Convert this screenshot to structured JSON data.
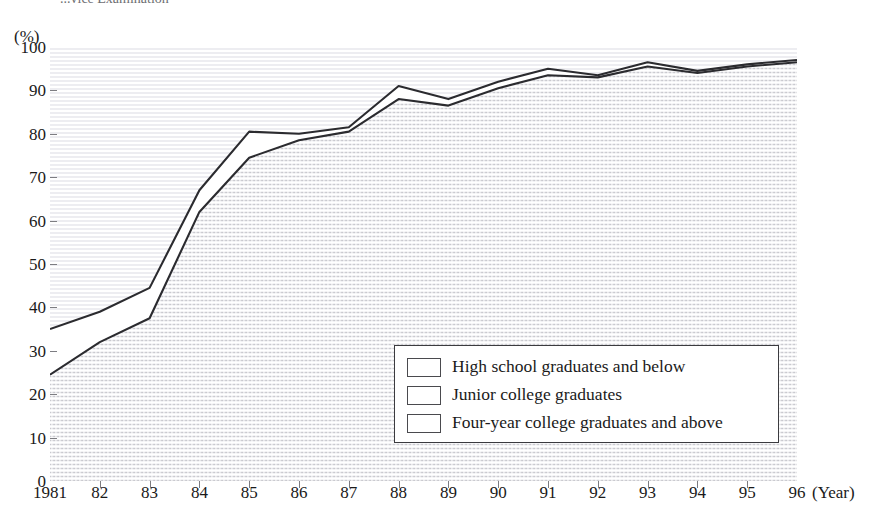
{
  "title": "...vice Examination",
  "unit_label": "(%)",
  "axis": {
    "x_title": "(Year)",
    "y_ticks": [
      "0",
      "10",
      "20",
      "30",
      "40",
      "50",
      "60",
      "70",
      "80",
      "90",
      "100"
    ],
    "x_ticks": [
      "1981",
      "82",
      "83",
      "84",
      "85",
      "86",
      "87",
      "88",
      "89",
      "90",
      "91",
      "92",
      "93",
      "94",
      "95",
      "96"
    ]
  },
  "legend": {
    "items": [
      {
        "label": "High school graduates and below",
        "swatch": "band-bottom"
      },
      {
        "label": "Junior college graduates",
        "swatch": "band-mid"
      },
      {
        "label": "Four-year college graduates and above",
        "swatch": "band-top"
      }
    ]
  },
  "colors": {
    "line": "#2b2b2f",
    "frame": "#8a8a8e",
    "hatch": "#c9c9cf",
    "text": "#1a1a1a"
  },
  "chart_data": {
    "type": "line",
    "title": "...vice Examination",
    "xlabel": "(Year)",
    "ylabel": "(%)",
    "ylim": [
      0,
      100
    ],
    "ytick_step": 10,
    "grid": false,
    "legend_position": "inside-bottom-right",
    "x": [
      "1981",
      "82",
      "83",
      "84",
      "85",
      "86",
      "87",
      "88",
      "89",
      "90",
      "91",
      "92",
      "93",
      "94",
      "95",
      "96"
    ],
    "series": [
      {
        "name": "Four-year college graduates and above",
        "values": [
          35,
          39,
          44.5,
          67,
          80.5,
          80,
          81.5,
          91,
          88,
          92,
          95,
          93.5,
          96.5,
          94.5,
          96,
          97
        ]
      },
      {
        "name": "Junior college graduates",
        "values": [
          24.5,
          32,
          37.5,
          62,
          74.5,
          78.5,
          80.5,
          88,
          86.5,
          90.5,
          93.5,
          93,
          95.5,
          94,
          95.5,
          96.5
        ]
      }
    ]
  }
}
